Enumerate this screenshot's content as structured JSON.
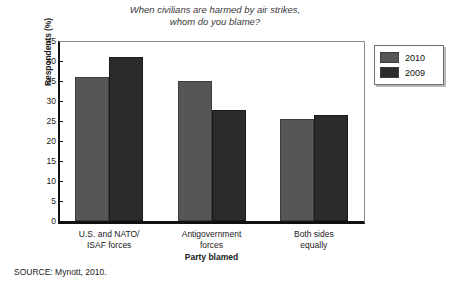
{
  "chart_data": {
    "type": "bar",
    "title": "When civilians are harmed by air strikes, whom do you blame?",
    "title_lines": [
      "When civilians are harmed by air strikes,",
      "whom do you blame?"
    ],
    "xlabel": "Party blamed",
    "ylabel": "Respondents (%)",
    "ylim": [
      0,
      45
    ],
    "ytick_step": 5,
    "yticks": [
      "45",
      "40",
      "35",
      "30",
      "25",
      "20",
      "15",
      "10",
      "5",
      "0"
    ],
    "grid": false,
    "legend_position": "right-outside",
    "categories": [
      "U.S. and NATO/ ISAF forces",
      "Antigovernment forces",
      "Both sides equally"
    ],
    "category_lines": [
      [
        "U.S. and NATO/",
        "ISAF forces"
      ],
      [
        "Antigovernment",
        "forces"
      ],
      [
        "Both sides",
        "equally"
      ]
    ],
    "series": [
      {
        "name": "2010",
        "color": "#565656",
        "values": [
          36.0,
          35.0,
          25.5
        ]
      },
      {
        "name": "2009",
        "color": "#2b2b2b",
        "values": [
          41.0,
          27.7,
          26.4
        ]
      }
    ]
  },
  "legend": {
    "items": [
      {
        "label": "2010"
      },
      {
        "label": "2009"
      }
    ]
  },
  "source": {
    "text": "SOURCE: Mynott, 2010."
  }
}
